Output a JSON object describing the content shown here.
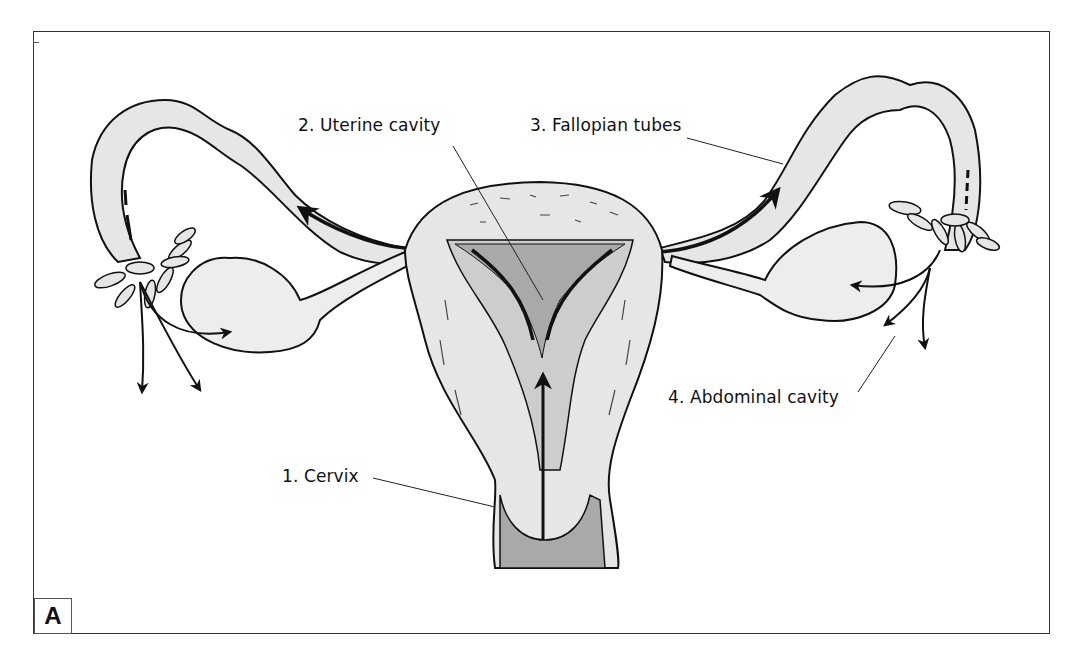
{
  "figure": {
    "panel_label": "A",
    "colors": {
      "tissue_fill": "#e6e6e6",
      "cavity_fill": "#a9a9a9",
      "outline": "#111111",
      "frame": "#333333"
    }
  },
  "labels": [
    {
      "id": "cervix",
      "text": "1. Cervix"
    },
    {
      "id": "uterine-cavity",
      "text": "2. Uterine cavity"
    },
    {
      "id": "fallopian-tubes",
      "text": "3. Fallopian tubes"
    },
    {
      "id": "abdominal-cavity",
      "text": "4. Abdominal cavity"
    }
  ]
}
